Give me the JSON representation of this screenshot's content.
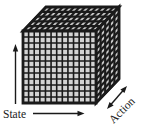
{
  "diagram": {
    "labels": {
      "state": "State",
      "action": "Action"
    },
    "cube": {
      "columns": 13,
      "rows": 12,
      "depth": 5
    },
    "colors": {
      "ink": "#1a1a1a",
      "front_cell": "#d3d3d3",
      "top_cell": "#c6c6c6",
      "side_cell": "#c9c9c9",
      "background": "#ffffff"
    }
  }
}
